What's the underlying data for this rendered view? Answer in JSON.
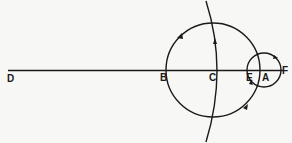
{
  "diagram": {
    "type": "geometric-construction",
    "labels": {
      "D": "D",
      "B": "B",
      "C": "C",
      "E": "E",
      "A": "A",
      "F": "F"
    },
    "elements": [
      {
        "kind": "line",
        "name": "line DF",
        "from": "D",
        "to": "F"
      },
      {
        "kind": "circle",
        "name": "large circle",
        "through": [
          "B",
          "E"
        ],
        "center_near": "C",
        "arrows": 2
      },
      {
        "kind": "circle",
        "name": "small circle",
        "center": "A",
        "through": [
          "E",
          "F"
        ],
        "arrows": 2
      },
      {
        "kind": "arc",
        "name": "long arc through C",
        "arrows": 1
      }
    ],
    "colors": {
      "ink": "#1a1a1a",
      "paper": "#f7f7f5"
    }
  }
}
